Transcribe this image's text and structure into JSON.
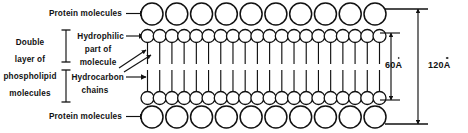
{
  "figure": {
    "type": "cell-membrane-cross-section-diagram",
    "background_color": "#ffffff",
    "ink_color": "#111111"
  },
  "labels": {
    "protein_top": "Protein molecules",
    "protein_bottom": "Protein molecules",
    "double_layer_line1": "Double",
    "double_layer_line2": "layer of",
    "double_layer_line3": "phospholipid",
    "double_layer_line4": "molecules",
    "hydrophilic_line1": "Hydrophilic",
    "hydrophilic_line2": "part of",
    "hydrophilic_line3": "molecule",
    "hydrocarbon_line1": "Hydrocarbon",
    "hydrocarbon_line2": "chains"
  },
  "measurements": {
    "inner_value": "60",
    "inner_unit": "A",
    "outer_value": "120",
    "outer_unit": "A"
  },
  "structure": {
    "protein_row_count": 2,
    "head_row_count": 2,
    "large_circle_diameter_px": 22,
    "small_circle_diameter_px": 13,
    "large_circles_per_row": 10,
    "small_circles_per_row": 20,
    "hydrocarbon_chain_count": 40
  },
  "icons": {
    "pointer_arrow": "arrow-right-icon",
    "range_bracket": "i-bar-bracket-icon",
    "dimension_arrow": "double-headed-arrow-icon"
  }
}
